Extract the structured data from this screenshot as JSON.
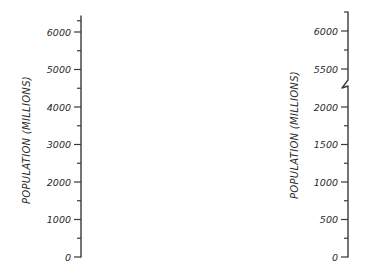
{
  "chart_data": [
    {
      "type": "line",
      "title": "",
      "xlabel": "",
      "ylabel": "POPULATION (MILLIONS)",
      "ylim": [
        0,
        6000
      ],
      "grid": false,
      "yticks": [
        0,
        1000,
        2000,
        3000,
        4000,
        5000,
        6000
      ],
      "ytick_labels": [
        "0",
        "1000",
        "2000",
        "3000",
        "4000",
        "5000",
        "6000"
      ],
      "minor_ticks": [
        500,
        1500,
        2500,
        3500,
        4500,
        5500,
        6300
      ],
      "axis_break": false,
      "series": []
    },
    {
      "type": "line",
      "title": "",
      "xlabel": "",
      "ylabel": "POPULATION (MILLIONS)",
      "ylim": [
        0,
        6000
      ],
      "grid": false,
      "axis_break": true,
      "break_between": [
        2000,
        5500
      ],
      "yticks": [
        0,
        500,
        1000,
        1500,
        2000,
        5500,
        6000
      ],
      "ytick_labels": [
        "0",
        "500",
        "1000",
        "1500",
        "2000",
        "5500",
        "6000"
      ],
      "minor_ticks": [
        250,
        750,
        1250,
        1750,
        5750,
        6250
      ],
      "series": []
    }
  ]
}
